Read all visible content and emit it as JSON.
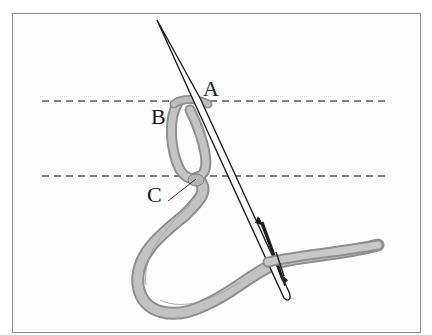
{
  "diagram": {
    "type": "embroidery-stitch-illustration",
    "labels": {
      "a": "A",
      "b": "B",
      "c": "C"
    },
    "guide_lines": [
      {
        "y": 101,
        "style": "dashed"
      },
      {
        "y": 176,
        "style": "dashed"
      }
    ],
    "colors": {
      "frame": "#8c8c8c",
      "thread_fill": "#b9b9b9",
      "thread_shadow": "#8f8f8f",
      "needle_outline": "#1f1f1f",
      "guide_line": "#555555",
      "text": "#1a1a1a"
    }
  }
}
